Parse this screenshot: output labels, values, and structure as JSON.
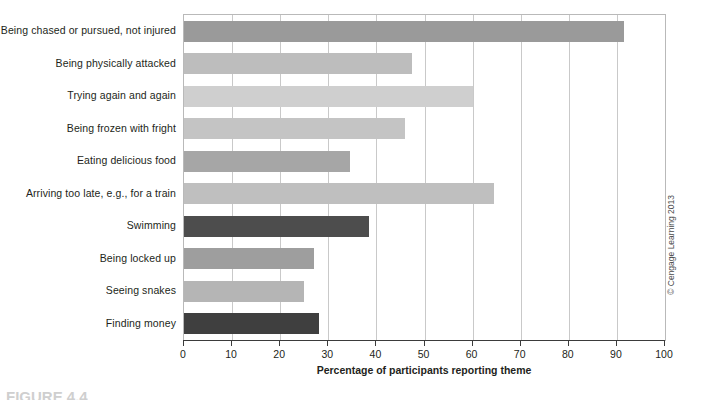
{
  "chart_data": {
    "type": "bar",
    "orientation": "horizontal",
    "title": "",
    "xlabel": "Percentage of participants reporting theme",
    "ylabel": "",
    "xlim": [
      0,
      100
    ],
    "xticks": [
      0,
      10,
      20,
      30,
      40,
      50,
      60,
      70,
      80,
      90,
      100
    ],
    "grid": "vertical",
    "legend": "none",
    "categories": [
      "Being chased or pursued, not injured",
      "Being physically attacked",
      "Trying again and again",
      "Being frozen with fright",
      "Eating delicious food",
      "Arriving too late, e.g., for a train",
      "Swimming",
      "Being locked up",
      "Seeing snakes",
      "Finding money"
    ],
    "values": [
      91.5,
      47.5,
      60.0,
      46.0,
      34.5,
      64.5,
      38.5,
      27.0,
      25.0,
      28.0
    ],
    "bar_colors": [
      "#9a9a9a",
      "#bdbdbd",
      "#cfcfcf",
      "#c4c4c4",
      "#a6a6a6",
      "#bfbfbf",
      "#4d4d4d",
      "#9e9e9e",
      "#b5b5b5",
      "#3f3f3f"
    ]
  },
  "credit": {
    "text": "© Cengage Learning 2013"
  },
  "bottom_caption": {
    "text": "FIGURE 4.4"
  },
  "colors": {
    "axis": "#3b3b3b",
    "gridline": "#c9c9c9",
    "frame": "#b9b9b9",
    "text": "#231f20",
    "background": "#ffffff"
  }
}
